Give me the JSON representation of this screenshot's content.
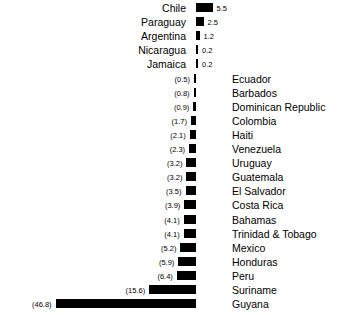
{
  "chart_data": {
    "type": "bar",
    "orientation": "horizontal",
    "title": "",
    "subtitle": "",
    "xlabel": "",
    "ylabel": "",
    "grid": false,
    "legend": null,
    "axis_zero": 0,
    "xlim": [
      -46.8,
      5.5
    ],
    "categories": [
      "Chile",
      "Paraguay",
      "Argentina",
      "Nicaragua",
      "Jamaica",
      "Ecuador",
      "Barbados",
      "Dominican Republic",
      "Colombia",
      "Haiti",
      "Venezuela",
      "Uruguay",
      "Guatemala",
      "El Salvador",
      "Costa Rica",
      "Bahamas",
      "Trinidad & Tobago",
      "Mexico",
      "Honduras",
      "Peru",
      "Suriname",
      "Guyana"
    ],
    "values": [
      5.5,
      2.5,
      1.2,
      0.2,
      0.2,
      -0.5,
      -0.8,
      -0.9,
      -1.7,
      -2.1,
      -2.3,
      -3.2,
      -3.2,
      -3.5,
      -3.9,
      -4.1,
      -4.1,
      -5.2,
      -5.9,
      -6.4,
      -15.6,
      -46.8
    ],
    "value_labels": [
      "5.5",
      "2.5",
      "1.2",
      "0.2",
      "0.2",
      "(0.5)",
      "(0.8)",
      "(0.9)",
      "(1.7)",
      "(2.1)",
      "(2.3)",
      "(3.2)",
      "(3.2)",
      "(3.5)",
      "(3.9)",
      "(4.1)",
      "(4.1)",
      "(5.2)",
      "(5.9)",
      "(6.4)",
      "(15.6)",
      "(46.8)"
    ],
    "bar_color": "#000000",
    "background_color": "#ffffff"
  },
  "rows": [
    {
      "name": "Chile",
      "label": "5.5",
      "value": 5.5,
      "sign": "positive"
    },
    {
      "name": "Paraguay",
      "label": "2.5",
      "value": 2.5,
      "sign": "positive"
    },
    {
      "name": "Argentina",
      "label": "1.2",
      "value": 1.2,
      "sign": "positive"
    },
    {
      "name": "Nicaragua",
      "label": "0.2",
      "value": 0.2,
      "sign": "positive"
    },
    {
      "name": "Jamaica",
      "label": "0.2",
      "value": 0.2,
      "sign": "positive"
    },
    {
      "name": "Ecuador",
      "label": "(0.5)",
      "value": -0.5,
      "sign": "negative"
    },
    {
      "name": "Barbados",
      "label": "(0.8)",
      "value": -0.8,
      "sign": "negative"
    },
    {
      "name": "Dominican Republic",
      "label": "(0.9)",
      "value": -0.9,
      "sign": "negative"
    },
    {
      "name": "Colombia",
      "label": "(1.7)",
      "value": -1.7,
      "sign": "negative"
    },
    {
      "name": "Haiti",
      "label": "(2.1)",
      "value": -2.1,
      "sign": "negative"
    },
    {
      "name": "Venezuela",
      "label": "(2.3)",
      "value": -2.3,
      "sign": "negative"
    },
    {
      "name": "Uruguay",
      "label": "(3.2)",
      "value": -3.2,
      "sign": "negative"
    },
    {
      "name": "Guatemala",
      "label": "(3.2)",
      "value": -3.2,
      "sign": "negative"
    },
    {
      "name": "El Salvador",
      "label": "(3.5)",
      "value": -3.5,
      "sign": "negative"
    },
    {
      "name": "Costa Rica",
      "label": "(3.9)",
      "value": -3.9,
      "sign": "negative"
    },
    {
      "name": "Bahamas",
      "label": "(4.1)",
      "value": -4.1,
      "sign": "negative"
    },
    {
      "name": "Trinidad & Tobago",
      "label": "(4.1)",
      "value": -4.1,
      "sign": "negative"
    },
    {
      "name": "Mexico",
      "label": "(5.2)",
      "value": -5.2,
      "sign": "negative"
    },
    {
      "name": "Honduras",
      "label": "(5.9)",
      "value": -5.9,
      "sign": "negative"
    },
    {
      "name": "Peru",
      "label": "(6.4)",
      "value": -6.4,
      "sign": "negative"
    },
    {
      "name": "Suriname",
      "label": "(15.6)",
      "value": -15.6,
      "sign": "negative"
    },
    {
      "name": "Guyana",
      "label": "(46.8)",
      "value": -46.8,
      "sign": "negative"
    }
  ]
}
